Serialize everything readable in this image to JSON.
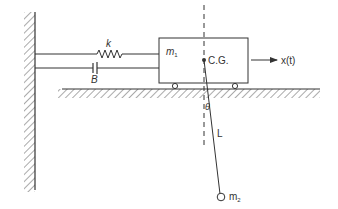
{
  "diagram": {
    "type": "mechanical-system-cart-pendulum",
    "colors": {
      "stroke": "#333333",
      "background": "#ffffff"
    },
    "labels": {
      "spring": "k",
      "damper": "B",
      "cart_mass": "m",
      "cart_mass_sub": "1",
      "center_of_gravity": "C.G.",
      "displacement": "x(t)",
      "angle": "θ",
      "pendulum_length": "L",
      "bob_mass": "m",
      "bob_mass_sub": "2"
    },
    "components": [
      {
        "id": "wall",
        "kind": "fixed-wall-hatched"
      },
      {
        "id": "spring",
        "kind": "spring",
        "label": "k"
      },
      {
        "id": "damper",
        "kind": "dashpot",
        "label": "B"
      },
      {
        "id": "cart",
        "kind": "mass-block-on-wheels",
        "label": "m1"
      },
      {
        "id": "ground",
        "kind": "hatched-ground"
      },
      {
        "id": "vertical-reference",
        "kind": "dashed-line"
      },
      {
        "id": "pendulum",
        "kind": "rod",
        "label": "L"
      },
      {
        "id": "bob",
        "kind": "point-mass",
        "label": "m2"
      },
      {
        "id": "force-arrow",
        "kind": "arrow",
        "label": "x(t)"
      }
    ]
  }
}
